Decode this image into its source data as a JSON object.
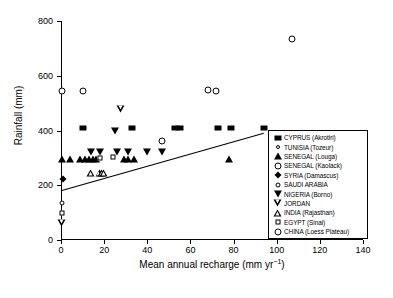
{
  "chart_data": {
    "type": "scatter",
    "title": "",
    "xlabel": "Mean annual recharge (mm yr−1)",
    "xlabel_main": "Mean annual recharge (mm yr",
    "xlabel_sup": "−1",
    "xlabel_tail": ")",
    "ylabel": "Rainfall (mm)",
    "xlim": [
      0,
      140
    ],
    "ylim": [
      0,
      800
    ],
    "xticks": [
      0,
      20,
      40,
      60,
      80,
      100,
      120,
      140
    ],
    "yticks": [
      0,
      200,
      400,
      600,
      800
    ],
    "grid": false,
    "legend_position": "right-inside",
    "trendline": {
      "x": [
        0,
        94
      ],
      "y": [
        180,
        390
      ]
    },
    "series": [
      {
        "name": "CYPRUS (Akrotiri)",
        "marker": "filled-square",
        "points": [
          {
            "x": 10,
            "y": 408
          },
          {
            "x": 33,
            "y": 408
          },
          {
            "x": 53,
            "y": 408
          },
          {
            "x": 55,
            "y": 408
          },
          {
            "x": 73,
            "y": 410
          },
          {
            "x": 79,
            "y": 410
          },
          {
            "x": 94,
            "y": 410
          }
        ]
      },
      {
        "name": "TUNISIA (Tozeur)",
        "marker": "tiny-open-circle",
        "points": [
          {
            "x": 0.5,
            "y": 100
          }
        ]
      },
      {
        "name": "SENEGAL (Louga)",
        "marker": "filled-triangle-up",
        "points": [
          {
            "x": 0.5,
            "y": 295
          },
          {
            "x": 4,
            "y": 295
          },
          {
            "x": 9,
            "y": 295
          },
          {
            "x": 11,
            "y": 295
          },
          {
            "x": 13,
            "y": 295
          },
          {
            "x": 15,
            "y": 295
          },
          {
            "x": 16,
            "y": 295
          },
          {
            "x": 29,
            "y": 295
          },
          {
            "x": 31,
            "y": 295
          },
          {
            "x": 34,
            "y": 295
          },
          {
            "x": 78,
            "y": 297
          }
        ]
      },
      {
        "name": "SENEGAL (Kaolack)",
        "marker": "open-circle",
        "points": [
          {
            "x": 47,
            "y": 363
          }
        ]
      },
      {
        "name": "SYRIA (Damascus)",
        "marker": "filled-diamond",
        "points": [
          {
            "x": 1,
            "y": 222
          }
        ]
      },
      {
        "name": "SAUDI ARABIA",
        "marker": "small-open-circle",
        "points": [
          {
            "x": 0.5,
            "y": 135
          }
        ]
      },
      {
        "name": "NIGERIA (Borno)",
        "marker": "filled-triangle-down",
        "points": [
          {
            "x": 14,
            "y": 322
          },
          {
            "x": 18,
            "y": 322
          },
          {
            "x": 25,
            "y": 400
          },
          {
            "x": 26,
            "y": 322
          },
          {
            "x": 31,
            "y": 322
          },
          {
            "x": 40,
            "y": 323
          },
          {
            "x": 47,
            "y": 323
          }
        ]
      },
      {
        "name": "JORDAN",
        "marker": "open-triangle-down",
        "points": [
          {
            "x": 0.5,
            "y": 62
          },
          {
            "x": 28,
            "y": 478
          }
        ]
      },
      {
        "name": "INDIA (Rajasthan)",
        "marker": "open-triangle-up",
        "points": [
          {
            "x": 14,
            "y": 245
          },
          {
            "x": 18,
            "y": 245
          },
          {
            "x": 19,
            "y": 245
          },
          {
            "x": 20,
            "y": 245
          }
        ]
      },
      {
        "name": "EGYPT (Sinai)",
        "marker": "open-square",
        "points": [
          {
            "x": 0.5,
            "y": 100
          },
          {
            "x": 18,
            "y": 298
          },
          {
            "x": 24,
            "y": 302
          }
        ]
      },
      {
        "name": "CHINA (Loess Plateau)",
        "marker": "open-circle",
        "points": [
          {
            "x": 0.5,
            "y": 546
          },
          {
            "x": 10,
            "y": 546
          },
          {
            "x": 68,
            "y": 548
          },
          {
            "x": 72,
            "y": 546
          },
          {
            "x": 107,
            "y": 735
          }
        ]
      }
    ]
  },
  "axes": {
    "xticklabels": [
      "0",
      "20",
      "40",
      "60",
      "80",
      "100",
      "120",
      "140"
    ],
    "yticklabels": [
      "0",
      "200",
      "400",
      "600",
      "800"
    ],
    "xlabel_main": "Mean annual recharge (mm yr",
    "xlabel_sup": "−1",
    "xlabel_tail": ")",
    "ylabel": "Rainfall (mm)"
  },
  "legend": {
    "items": [
      {
        "label": "CYPRUS (Akrotiri)",
        "marker": "filled-square"
      },
      {
        "label": "TUNISIA (Tozeur)",
        "marker": "tiny-open-circle"
      },
      {
        "label": "SENEGAL (Louga)",
        "marker": "filled-triangle-up"
      },
      {
        "label": "SENEGAL (Kaolack)",
        "marker": "open-circle"
      },
      {
        "label": "SYRIA (Damascus)",
        "marker": "filled-diamond"
      },
      {
        "label": "SAUDI ARABIA",
        "marker": "small-open-circle"
      },
      {
        "label": "NIGERIA (Borno)",
        "marker": "filled-triangle-down"
      },
      {
        "label": "JORDAN",
        "marker": "open-triangle-down"
      },
      {
        "label": "INDIA (Rajasthan)",
        "marker": "open-triangle-up"
      },
      {
        "label": "EGYPT (Sinai)",
        "marker": "open-square"
      },
      {
        "label": "CHINA (Loess Plateau)",
        "marker": "open-circle"
      }
    ]
  },
  "colors": {
    "foreground": "#000000",
    "background": "#ffffff"
  }
}
